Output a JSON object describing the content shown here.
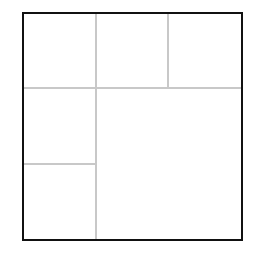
{
  "diagram": {
    "type": "rectangular-subdivision",
    "canvas": {
      "width": 257,
      "height": 254,
      "background": "#ffffff"
    },
    "frame": {
      "x": 23,
      "y": 13,
      "width": 219,
      "height": 227,
      "stroke": "#111111",
      "stroke_width": 2
    },
    "divider_color": "#c8c8c8",
    "divider_width": 2,
    "dividers": [
      {
        "id": "v1",
        "x1": 96,
        "y1": 13,
        "x2": 96,
        "y2": 240
      },
      {
        "id": "h1",
        "x1": 23,
        "y1": 88,
        "x2": 242,
        "y2": 88
      },
      {
        "id": "v2",
        "x1": 168,
        "y1": 13,
        "x2": 168,
        "y2": 88
      },
      {
        "id": "h2",
        "x1": 23,
        "y1": 164,
        "x2": 96,
        "y2": 164
      }
    ],
    "cells": [
      {
        "id": "cell-top-left",
        "x": 23,
        "y": 13,
        "w": 73,
        "h": 75
      },
      {
        "id": "cell-top-middle",
        "x": 96,
        "y": 13,
        "w": 72,
        "h": 75
      },
      {
        "id": "cell-top-right",
        "x": 168,
        "y": 13,
        "w": 74,
        "h": 75
      },
      {
        "id": "cell-middle-left",
        "x": 23,
        "y": 88,
        "w": 73,
        "h": 76
      },
      {
        "id": "cell-bottom-left",
        "x": 23,
        "y": 164,
        "w": 73,
        "h": 76
      },
      {
        "id": "cell-large-bottom-right",
        "x": 96,
        "y": 88,
        "w": 146,
        "h": 152
      }
    ]
  }
}
